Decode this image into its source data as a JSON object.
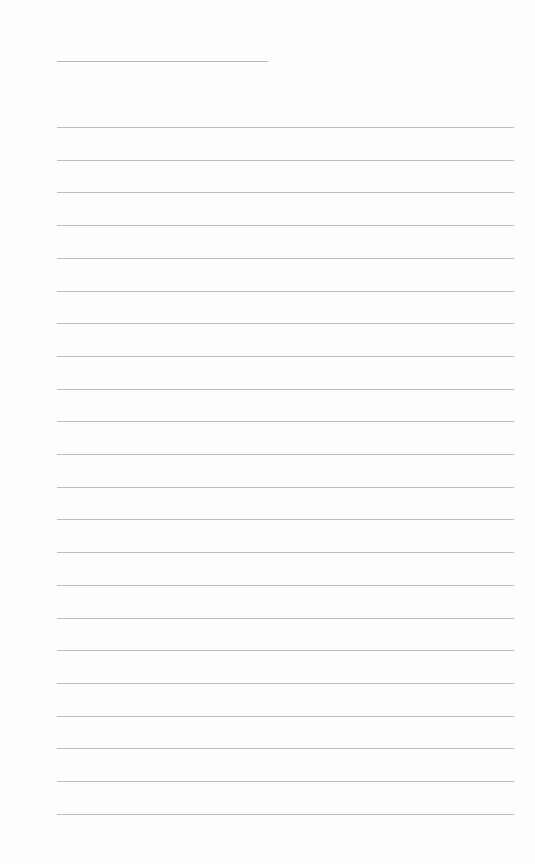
{
  "page": {
    "type": "ruled-paper",
    "background_color": "#fefefe",
    "line_color": "#bdbdbd",
    "title_line": {
      "left": 57,
      "top": 61,
      "width": 211
    },
    "ruled_lines": {
      "left": 57,
      "width": 457,
      "first_top": 127,
      "spacing": 32.7,
      "count": 22
    }
  }
}
